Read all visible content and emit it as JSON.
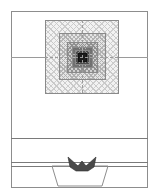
{
  "figure": {
    "title": "",
    "background_color": "#ffffff",
    "frame": {
      "stroke_color": "#8d8d8d",
      "x": 11,
      "y": 11,
      "width": 137,
      "height": 177
    },
    "horizontal_rules": [
      {
        "name": "upper-divider",
        "y": 57,
        "style": "solid",
        "color": "#9a9a9a"
      },
      {
        "name": "mid-divider",
        "y": 138,
        "style": "solid",
        "color": "#7a7a7a"
      },
      {
        "name": "lower-divider-1",
        "y": 162,
        "style": "solid",
        "color": "#7a7a7a"
      },
      {
        "name": "lower-divider-2",
        "y": 166,
        "style": "solid",
        "color": "#7a7a7a"
      }
    ],
    "concentric_squares": {
      "description": "nested cross-hatched squares with increasing fill density toward centre",
      "center_x": 82,
      "center_y": 57,
      "layers": [
        {
          "level": 1,
          "x": 45,
          "y": 20,
          "size": 74,
          "fill": "#f2f2f2",
          "stroke": "#8a8a8a"
        },
        {
          "level": 2,
          "x": 59,
          "y": 33,
          "size": 47,
          "fill": "#e4e4e4",
          "stroke": "#8a8a8a"
        },
        {
          "level": 3,
          "x": 67,
          "y": 42,
          "size": 31,
          "fill": "#cfcfcf",
          "stroke": "#8a8a8a"
        },
        {
          "level": 4,
          "x": 72,
          "y": 47,
          "size": 21,
          "fill": "#b4b4b4",
          "stroke": "#7a7a7a"
        },
        {
          "level": 5,
          "x": 75,
          "y": 50,
          "size": 15,
          "fill": "#8e8e8e",
          "stroke": "#6a6a6a"
        },
        {
          "level": 6,
          "x": 78,
          "y": 53,
          "size": 9,
          "fill": "#1c1c1c",
          "stroke": "#111111"
        }
      ]
    },
    "lower_assembly": {
      "trapezoid": {
        "name": "vessel-outline",
        "top_left_x": 52,
        "top_right_x": 108,
        "bottom_left_x": 58,
        "bottom_right_x": 102,
        "top_y": 166,
        "bottom_y": 186,
        "stroke": "#8d8d8d"
      },
      "v_marker": {
        "name": "nozzle-v-marker",
        "x": 68,
        "y": 157,
        "width": 28,
        "height": 14,
        "fill": "#4a4a4a"
      }
    }
  },
  "palette": {
    "frame_stroke": "#8d8d8d",
    "rule_stroke": "#7a7a7a",
    "core_fill": "#1c1c1c",
    "page_background": "#ffffff"
  }
}
